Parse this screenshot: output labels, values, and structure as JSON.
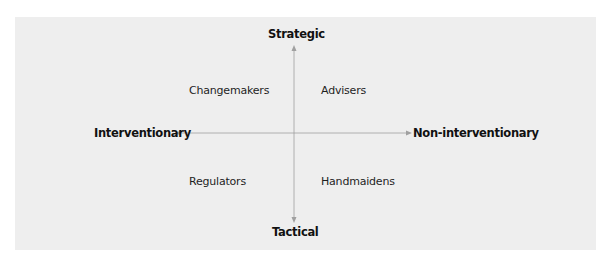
{
  "diagram": {
    "type": "quadrant",
    "axes": {
      "top": "Strategic",
      "bottom": "Tactical",
      "left": "Interventionary",
      "right": "Non-interventionary"
    },
    "quadrants": {
      "top_left": "Changemakers",
      "top_right": "Advisers",
      "bottom_left": "Regulators",
      "bottom_right": "Handmaidens"
    },
    "colors": {
      "background": "#eeeeee",
      "axis_line": "#9a9a9a",
      "text": "#1e1e1e"
    }
  }
}
